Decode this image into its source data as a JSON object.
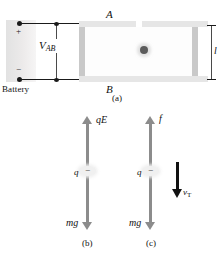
{
  "figure": {
    "background_color": "#ffffff"
  },
  "part_a": {
    "caption": "(a)",
    "battery": {
      "label": "Battery",
      "positive_terminal_sign": "+",
      "negative_terminal_sign": "−",
      "body_color": "#e9e7e7"
    },
    "voltage": {
      "label": "V",
      "subscript": "AB"
    },
    "capacitor": {
      "top_plate_label": "A",
      "bottom_plate_label": "B",
      "plate_color": "#e6e6e6",
      "separation_label": "l",
      "droplet_color": "#5b5b5b"
    }
  },
  "part_b": {
    "caption": "(b)",
    "up_force_label": "qE",
    "down_force_label": "mg",
    "charge_label": "q",
    "charge_sign": "−",
    "arrow_color": "#8c8c8c"
  },
  "part_c": {
    "caption": "(c)",
    "up_force_label": "f",
    "down_force_label": "mg",
    "charge_label": "q",
    "charge_sign": "−",
    "velocity_label": "v",
    "velocity_subscript": "T",
    "velocity_arrow_color": "#111111",
    "arrow_color": "#8c8c8c"
  }
}
